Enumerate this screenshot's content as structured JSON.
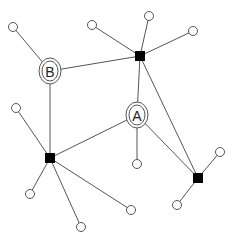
{
  "diagram": {
    "type": "network-graph",
    "colors": {
      "edge": "#555555",
      "hub": "#000000",
      "leaf_fill": "#ffffff"
    },
    "nodes": [
      {
        "id": "H1",
        "kind": "hub",
        "x": 140,
        "y": 56
      },
      {
        "id": "H2",
        "kind": "hub",
        "x": 50,
        "y": 158
      },
      {
        "id": "H3",
        "kind": "hub",
        "x": 198,
        "y": 178
      },
      {
        "id": "A",
        "kind": "labeled",
        "label": "A",
        "x": 137,
        "y": 115
      },
      {
        "id": "B",
        "kind": "labeled",
        "label": "B",
        "x": 50,
        "y": 71
      },
      {
        "id": "L1",
        "kind": "leaf",
        "x": 13,
        "y": 27
      },
      {
        "id": "L2",
        "kind": "leaf",
        "x": 92,
        "y": 25
      },
      {
        "id": "L3",
        "kind": "leaf",
        "x": 149,
        "y": 16
      },
      {
        "id": "L4",
        "kind": "leaf",
        "x": 193,
        "y": 31
      },
      {
        "id": "L5",
        "kind": "leaf",
        "x": 16,
        "y": 108
      },
      {
        "id": "L6",
        "kind": "leaf",
        "x": 137,
        "y": 164
      },
      {
        "id": "L7",
        "kind": "leaf",
        "x": 30,
        "y": 194
      },
      {
        "id": "L8",
        "kind": "leaf",
        "x": 81,
        "y": 227
      },
      {
        "id": "L9",
        "kind": "leaf",
        "x": 131,
        "y": 210
      },
      {
        "id": "L10",
        "kind": "leaf",
        "x": 220,
        "y": 152
      },
      {
        "id": "L11",
        "kind": "leaf",
        "x": 177,
        "y": 205
      }
    ],
    "edges": [
      [
        "B",
        "L1"
      ],
      [
        "B",
        "H1"
      ],
      [
        "B",
        "H2"
      ],
      [
        "H1",
        "L2"
      ],
      [
        "H1",
        "L3"
      ],
      [
        "H1",
        "L4"
      ],
      [
        "H1",
        "A"
      ],
      [
        "H1",
        "H3"
      ],
      [
        "A",
        "H2"
      ],
      [
        "A",
        "L6"
      ],
      [
        "A",
        "H3"
      ],
      [
        "H2",
        "L5"
      ],
      [
        "H2",
        "L7"
      ],
      [
        "H2",
        "L8"
      ],
      [
        "H2",
        "L9"
      ],
      [
        "H3",
        "L10"
      ],
      [
        "H3",
        "L11"
      ]
    ]
  }
}
